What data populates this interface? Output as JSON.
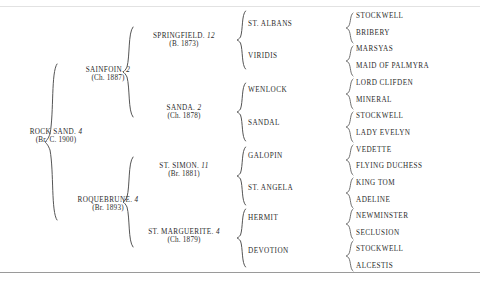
{
  "document": {
    "type": "pedigree-chart",
    "subject": "ROCK SAND"
  },
  "generations": {
    "gen1": [
      {
        "name": "ROCK SAND.",
        "suffix": "4",
        "detail": "(Br. C. 1900)"
      }
    ],
    "gen2": [
      {
        "name": "SAINFOIN.",
        "suffix": "2",
        "detail": "(Ch. 1887)"
      },
      {
        "name": "ROQUEBRUNE.",
        "suffix": "4",
        "detail": "(Br. 1893)"
      }
    ],
    "gen3": [
      {
        "name": "SPRINGFIELD.",
        "suffix": "12",
        "detail": "(B. 1873)"
      },
      {
        "name": "SANDA.",
        "suffix": "2",
        "detail": "(Ch. 1878)"
      },
      {
        "name": "ST. SIMON.",
        "suffix": "11",
        "detail": "(Br. 1881)"
      },
      {
        "name": "ST. MARGUERITE.",
        "suffix": "4",
        "detail": "(Ch. 1879)"
      }
    ],
    "gen4": [
      {
        "name": "ST. ALBANS"
      },
      {
        "name": "VIRIDIS"
      },
      {
        "name": "WENLOCK"
      },
      {
        "name": "SANDAL"
      },
      {
        "name": "GALOPIN"
      },
      {
        "name": "ST. ANGELA"
      },
      {
        "name": "HERMIT"
      },
      {
        "name": "DEVOTION"
      }
    ],
    "gen5": [
      {
        "name": "STOCKWELL"
      },
      {
        "name": "BRIBERY"
      },
      {
        "name": "MARSYAS"
      },
      {
        "name": "MAID OF PALMYRA"
      },
      {
        "name": "LORD CLIFDEN"
      },
      {
        "name": "MINERAL"
      },
      {
        "name": "STOCKWELL"
      },
      {
        "name": "LADY EVELYN"
      },
      {
        "name": "VEDETTE"
      },
      {
        "name": "FLYING DUCHESS"
      },
      {
        "name": "KING TOM"
      },
      {
        "name": "ADELINE"
      },
      {
        "name": "NEWMINSTER"
      },
      {
        "name": "SECLUSION"
      },
      {
        "name": "STOCKWELL"
      },
      {
        "name": "ALCESTIS"
      }
    ]
  },
  "colors": {
    "text": "#2b2b2b",
    "brace": "#555555",
    "rule": "#9a9a9a",
    "background": "#ffffff"
  }
}
